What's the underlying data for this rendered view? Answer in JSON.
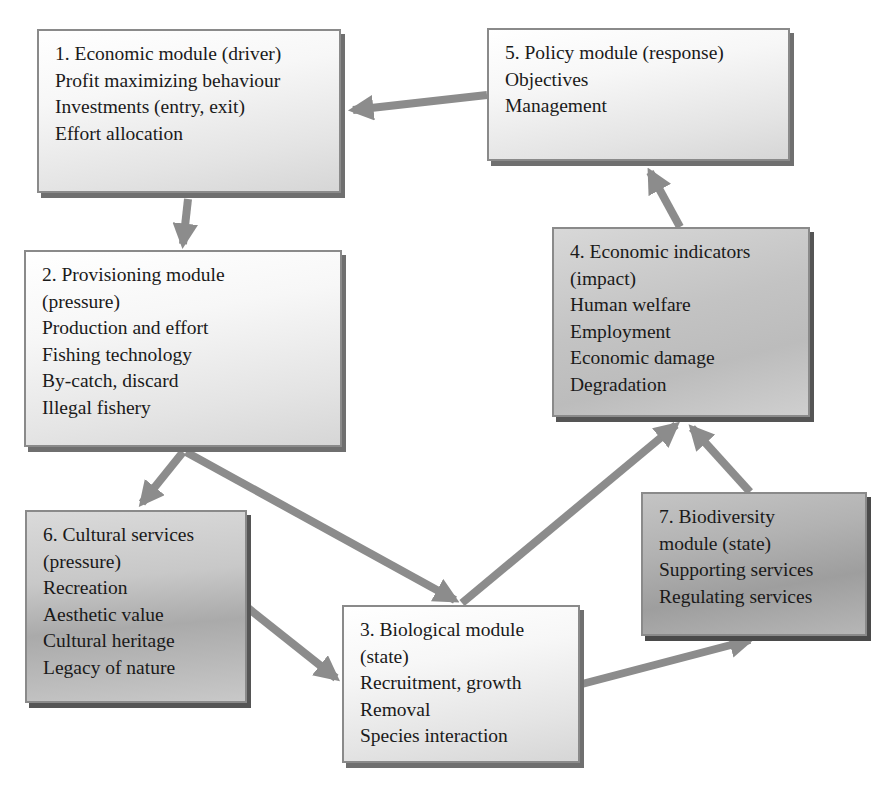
{
  "diagram": {
    "colors": {
      "arrow": "#8c8c8c",
      "border": "#8a8a8a",
      "text": "#1a1a1a"
    },
    "modules": [
      {
        "id": "m1",
        "title": "1. Economic module (driver)",
        "lines": [
          "Profit maximizing behaviour",
          "Investments (entry, exit)",
          "Effort allocation"
        ]
      },
      {
        "id": "m2",
        "title": "2. Provisioning module",
        "lines": [
          "(pressure)",
          "Production and effort",
          "Fishing technology",
          "By-catch, discard",
          "Illegal fishery"
        ]
      },
      {
        "id": "m3",
        "title": "3. Biological module",
        "lines": [
          "(state)",
          "Recruitment, growth",
          "Removal",
          "Species interaction"
        ]
      },
      {
        "id": "m4",
        "title": "4. Economic indicators",
        "lines": [
          "(impact)",
          "Human welfare",
          "Employment",
          "Economic damage",
          "Degradation"
        ]
      },
      {
        "id": "m5",
        "title": "5. Policy module (response)",
        "lines": [
          "Objectives",
          "Management"
        ]
      },
      {
        "id": "m6",
        "title": "6. Cultural services",
        "lines": [
          "(pressure)",
          "Recreation",
          "Aesthetic value",
          "Cultural heritage",
          "Legacy of nature"
        ]
      },
      {
        "id": "m7",
        "title": "7. Biodiversity",
        "lines": [
          "module (state)",
          "Supporting services",
          "Regulating services"
        ]
      }
    ],
    "arrows": [
      {
        "from": "m5",
        "to": "m1"
      },
      {
        "from": "m1",
        "to": "m2"
      },
      {
        "from": "m2",
        "to": "m6"
      },
      {
        "from": "m2",
        "to": "m3"
      },
      {
        "from": "m6",
        "to": "m3"
      },
      {
        "from": "m3",
        "to": "m4"
      },
      {
        "from": "m3",
        "to": "m7"
      },
      {
        "from": "m7",
        "to": "m4"
      },
      {
        "from": "m4",
        "to": "m5"
      }
    ]
  }
}
